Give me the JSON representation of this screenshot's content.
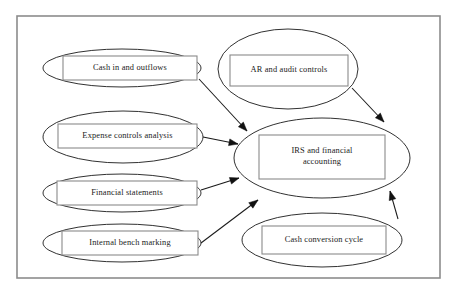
{
  "diagram": {
    "frame": {
      "x": 17,
      "y": 16,
      "width": 423,
      "height": 262,
      "stroke": "#8c8c8c"
    },
    "colors": {
      "ellipse_stroke": "#1a1a1a",
      "box_stroke": "#8a8a8a",
      "connector": "#1a1a1a",
      "text": "#1a1a1a",
      "background": "#ffffff"
    },
    "nodes": [
      {
        "id": "cash-in-and-outflows",
        "label": "Cash in and outflows",
        "lines": [
          "Cash in and outflows"
        ],
        "ellipse": {
          "cx": 122,
          "cy": 68,
          "rx": 79,
          "ry": 19
        },
        "box": {
          "x": 63,
          "y": 56,
          "width": 134,
          "height": 24
        }
      },
      {
        "id": "ar-and-audit-controls",
        "label": "AR and audit controls",
        "lines": [
          "AR and audit controls"
        ],
        "ellipse": {
          "cx": 288,
          "cy": 69,
          "rx": 70,
          "ry": 40
        },
        "box": {
          "x": 230,
          "y": 55,
          "width": 118,
          "height": 31
        }
      },
      {
        "id": "expense-controls-analysis",
        "label": "Expense controls analysis",
        "lines": [
          "Expense controls analysis"
        ],
        "ellipse": {
          "cx": 123,
          "cy": 137,
          "rx": 80,
          "ry": 26
        },
        "box": {
          "x": 58,
          "y": 124,
          "width": 139,
          "height": 24
        }
      },
      {
        "id": "financial-statements",
        "label": "Financial statements",
        "lines": [
          "Financial statements"
        ],
        "ellipse": {
          "cx": 122,
          "cy": 193,
          "rx": 79,
          "ry": 19
        },
        "box": {
          "x": 57,
          "y": 181,
          "width": 140,
          "height": 24
        }
      },
      {
        "id": "internal-bench-marking",
        "label": "Internal bench marking",
        "lines": [
          "Internal bench marking"
        ],
        "ellipse": {
          "cx": 122,
          "cy": 243,
          "rx": 79,
          "ry": 19
        },
        "box": {
          "x": 62,
          "y": 231,
          "width": 136,
          "height": 24
        }
      },
      {
        "id": "irs-and-financial-accounting",
        "label": "IRS and financial accounting",
        "lines": [
          "IRS and financial",
          "accounting"
        ],
        "ellipse": {
          "cx": 322,
          "cy": 158,
          "rx": 88,
          "ry": 40
        },
        "box": {
          "x": 259,
          "y": 135,
          "width": 126,
          "height": 44
        }
      },
      {
        "id": "cash-conversion-cycle",
        "label": "Cash conversion cycle",
        "lines": [
          "Cash conversion cycle"
        ],
        "ellipse": {
          "cx": 322,
          "cy": 240,
          "rx": 80,
          "ry": 27
        },
        "box": {
          "x": 262,
          "y": 226,
          "width": 124,
          "height": 28
        }
      }
    ],
    "edges": [
      {
        "id": "edge-cash-in-and-outflows-to-irs",
        "from": "cash-in-and-outflows",
        "to": "irs-and-financial-accounting",
        "path": "M 199 79 L 247 131",
        "arrow": {
          "x": 247,
          "y": 131,
          "angle": 47
        }
      },
      {
        "id": "edge-ar-and-audit-controls-to-irs",
        "from": "ar-and-audit-controls",
        "to": "irs-and-financial-accounting",
        "path": "M 352 88 L 384 122",
        "arrow": {
          "x": 384,
          "y": 122,
          "angle": 47
        }
      },
      {
        "id": "edge-expense-controls-analysis-to-irs",
        "from": "expense-controls-analysis",
        "to": "irs-and-financial-accounting",
        "path": "M 203 137 L 238 144",
        "arrow": {
          "x": 238,
          "y": 144,
          "angle": 11
        }
      },
      {
        "id": "edge-financial-statements-to-irs",
        "from": "financial-statements",
        "to": "irs-and-financial-accounting",
        "path": "M 201 190 L 239 178",
        "arrow": {
          "x": 239,
          "y": 178,
          "angle": -18
        }
      },
      {
        "id": "edge-internal-bench-marking-to-irs",
        "from": "internal-bench-marking",
        "to": "irs-and-financial-accounting",
        "path": "M 201 243 L 258 200",
        "arrow": {
          "x": 258,
          "y": 200,
          "angle": -37
        }
      },
      {
        "id": "edge-cash-conversion-cycle-to-irs",
        "from": "cash-conversion-cycle",
        "to": "irs-and-financial-accounting",
        "path": "M 398 219 L 390 191",
        "arrow": {
          "x": 390,
          "y": 191,
          "angle": -106
        }
      }
    ]
  }
}
